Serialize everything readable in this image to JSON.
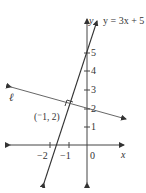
{
  "diagram": {
    "type": "coordinate-plane",
    "axes": {
      "x_label": "x",
      "y_label": "y",
      "origin_label": "0",
      "x_ticks": [
        "−2",
        "−1"
      ],
      "y_ticks": [
        "1",
        "2",
        "3",
        "4",
        "5"
      ]
    },
    "lines": [
      {
        "name": "steep-line",
        "equation_label": "y = 3x + 5",
        "slope": 3,
        "intercept": 5
      },
      {
        "name": "line-l",
        "label": "ℓ",
        "perpendicular_to": "y = 3x + 5"
      }
    ],
    "point": {
      "label": "(⁻1, 2)",
      "x": -1,
      "y": 2
    },
    "colors": {
      "line": "#333333",
      "axis": "#555555"
    }
  }
}
